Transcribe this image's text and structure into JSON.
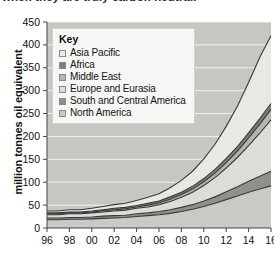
{
  "caption": {
    "text": "when they are truly carbon neutral."
  },
  "chart_data": {
    "type": "area",
    "title": "",
    "xlabel": "",
    "ylabel": "million tonnes oil equivalent",
    "ylim": [
      0,
      450
    ],
    "xlim": [
      1996,
      2016
    ],
    "grid": true,
    "legend_position": "top-left",
    "legend_title": "Key",
    "ytick_labels": [
      "0",
      "50",
      "100",
      "150",
      "200",
      "250",
      "300",
      "350",
      "400",
      "450"
    ],
    "ytick_values": [
      0,
      50,
      100,
      150,
      200,
      250,
      300,
      350,
      400,
      450
    ],
    "xtick_labels": [
      "96",
      "98",
      "00",
      "02",
      "04",
      "06",
      "08",
      "10",
      "12",
      "14",
      "16"
    ],
    "xtick_values": [
      1996,
      1998,
      2000,
      2002,
      2004,
      2006,
      2008,
      2010,
      2012,
      2014,
      2016
    ],
    "x": [
      1996,
      1997,
      1998,
      1999,
      2000,
      2001,
      2002,
      2003,
      2004,
      2005,
      2006,
      2007,
      2008,
      2009,
      2010,
      2011,
      2012,
      2013,
      2014,
      2015,
      2016
    ],
    "stack_order_bottom_to_top": [
      "North America",
      "South and Central America",
      "Europe and Eurasia",
      "Middle East",
      "Africa",
      "Asia Pacific"
    ],
    "series": [
      {
        "name": "North America",
        "color": "#c9c9c5",
        "values": [
          18,
          18,
          19,
          19,
          20,
          21,
          22,
          23,
          25,
          27,
          29,
          32,
          36,
          41,
          47,
          54,
          62,
          70,
          78,
          85,
          92
        ]
      },
      {
        "name": "South and Central America",
        "color": "#8f8f8c",
        "values": [
          4,
          4,
          4,
          4,
          4,
          5,
          5,
          5,
          6,
          6,
          7,
          8,
          9,
          10,
          12,
          14,
          17,
          20,
          24,
          28,
          32
        ]
      },
      {
        "name": "Europe and Eurasia",
        "color": "#dcdcd9",
        "values": [
          7,
          7,
          8,
          8,
          9,
          9,
          10,
          11,
          12,
          13,
          15,
          18,
          22,
          27,
          34,
          42,
          52,
          64,
          78,
          94,
          112
        ]
      },
      {
        "name": "Middle East",
        "color": "#b4b4b0",
        "values": [
          2,
          2,
          2,
          2,
          2,
          3,
          3,
          3,
          3,
          4,
          4,
          5,
          6,
          7,
          8,
          10,
          12,
          14,
          17,
          20,
          23
        ]
      },
      {
        "name": "Africa",
        "color": "#7c7c79",
        "values": [
          2,
          2,
          2,
          2,
          2,
          2,
          3,
          3,
          3,
          4,
          4,
          5,
          5,
          6,
          7,
          8,
          9,
          10,
          11,
          12,
          13
        ]
      },
      {
        "name": "Asia Pacific",
        "color": "#e8e8e5",
        "values": [
          4,
          4,
          5,
          5,
          6,
          7,
          8,
          9,
          11,
          13,
          16,
          20,
          26,
          33,
          43,
          55,
          70,
          88,
          110,
          134,
          148
        ]
      }
    ],
    "totals": [
      37,
      37,
      40,
      40,
      43,
      47,
      51,
      54,
      60,
      67,
      75,
      88,
      104,
      124,
      151,
      183,
      222,
      266,
      318,
      373,
      420
    ],
    "plot_background": "#c6c6c2"
  },
  "legend": {
    "title": "Key",
    "items": [
      {
        "label": "Asia Pacific",
        "swatch": "#e8e8e5"
      },
      {
        "label": "Africa",
        "swatch": "#7c7c79"
      },
      {
        "label": "Middle East",
        "swatch": "#b4b4b0"
      },
      {
        "label": "Europe and Eurasia",
        "swatch": "#dcdcd9"
      },
      {
        "label": "South and Central America",
        "swatch": "#8f8f8c"
      },
      {
        "label": "North America",
        "swatch": "#c9c9c5"
      }
    ]
  }
}
